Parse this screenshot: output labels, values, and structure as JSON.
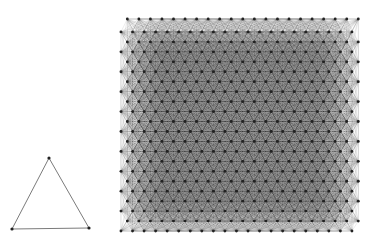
{
  "figure": {
    "background": "#ffffff",
    "edge_color": "#000000",
    "node_color": "#222222"
  },
  "graphs": [
    {
      "name": "triangle-graph",
      "node_count": 3,
      "edge_count": 3,
      "nodes": [
        {
          "x": 49,
          "y": 158
        },
        {
          "x": 12,
          "y": 229
        },
        {
          "x": 89,
          "y": 228
        }
      ],
      "edges": [
        [
          0,
          1
        ],
        [
          1,
          2
        ],
        [
          2,
          0
        ]
      ],
      "node_radius": 1.6,
      "edge_width": 0.7,
      "edge_opacity": 0.75
    },
    {
      "name": "dense-lattice-graph",
      "layout": "grid-with-offset-rows",
      "columns": 21,
      "rows": 22,
      "bounds": {
        "x0": 125,
        "y0": 22,
        "x1": 356,
        "y1": 231
      },
      "connection_radius_cells": 4,
      "node_radius": 1.4,
      "edge_width": 0.35,
      "edge_opacity": 0.22
    }
  ]
}
